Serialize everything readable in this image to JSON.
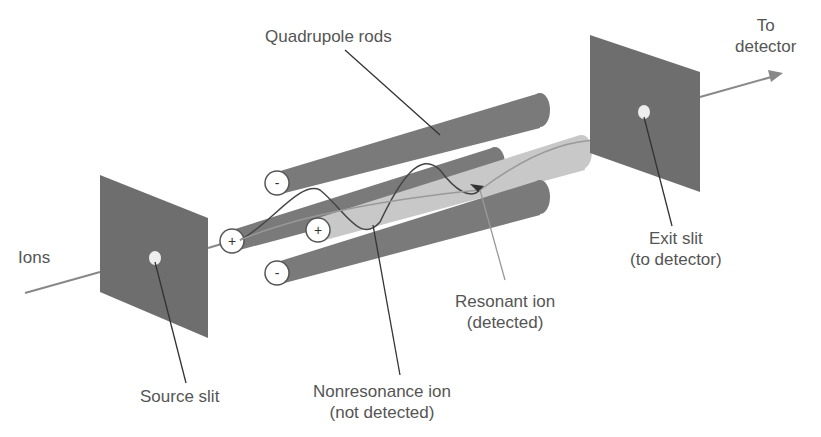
{
  "diagram": {
    "labels": {
      "ions": "Ions",
      "source_slit": "Source slit",
      "quadrupole_rods": "Quadrupole rods",
      "nonresonance_line1": "Nonresonance ion",
      "nonresonance_line2": "(not detected)",
      "resonant_line1": "Resonant ion",
      "resonant_line2": "(detected)",
      "exit_slit_line1": "Exit slit",
      "exit_slit_line2": "(to detector)",
      "to_detector_line1": "To",
      "to_detector_line2": "detector"
    },
    "rod_signs": {
      "top": "-",
      "left": "+",
      "right": "+",
      "bottom": "-"
    },
    "colors": {
      "plate": "#6e6e6e",
      "rod_dark": "#7a7a7a",
      "rod_light": "#c8c8c8",
      "label": "#555555"
    }
  }
}
